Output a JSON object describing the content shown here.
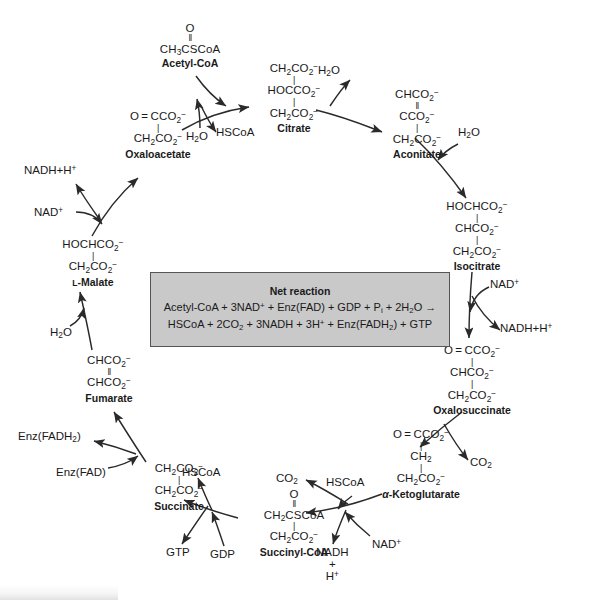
{
  "diagram": {
    "net_box": {
      "heading": "Net reaction",
      "line1_html": "Acetyl-CoA + 3NAD<sup>+</sup> + Enz(FAD) + GDP + P<sub>i</sub> + 2H<sub>2</sub>O →",
      "line2_html": "HSCoA + 2CO<sub>2</sub> + 3NADH + 3H<sup>+</sup> + Enz(FADH<sub>2</sub>) + GTP"
    },
    "metabolites": [
      {
        "id": "acetyl-coa",
        "name": "Acetyl-CoA",
        "structure_html": "<span class='ln'>O</span><span class='bondv'>‖</span><span class='ln'>CH<sub>3</sub>CSCoA</span>"
      },
      {
        "id": "citrate",
        "name": "Citrate",
        "structure_html": "<span class='ln'>CH<sub>2</sub>CO<sub>2</sub><sup>−</sup></span><span class='bondv'>|</span><span class='ln'>HOCCO<sub>2</sub><sup>−</sup></span><span class='bondv'>|</span><span class='ln'>CH<sub>2</sub>CO<sub>2</sub><sup>−</sup></span>"
      },
      {
        "id": "aconitate",
        "name": "Aconitate",
        "structure_html": "<span class='ln'>CHCO<sub>2</sub><sup>−</sup></span><span class='bondv'>‖</span><span class='ln'>CCO<sub>2</sub><sup>−</sup></span><span class='bondv'>|</span><span class='ln'>CH<sub>2</sub>CO<sub>2</sub><sup>−</sup></span>"
      },
      {
        "id": "isocitrate",
        "name": "Isocitrate",
        "structure_html": "<span class='ln'>HOCHCO<sub>2</sub><sup>−</sup></span><span class='bondv'>|</span><span class='ln'>CHCO<sub>2</sub><sup>−</sup></span><span class='bondv'>|</span><span class='ln'>CH<sub>2</sub>CO<sub>2</sub><sup>−</sup></span>"
      },
      {
        "id": "oxalosuccinate",
        "name": "Oxalosuccinate",
        "structure_html": "<span class='ln'>O = CCO<sub>2</sub><sup>−</sup></span><span class='bondv'>|</span><span class='ln'>CHCO<sub>2</sub><sup>−</sup></span><span class='bondv'>|</span><span class='ln'>CH<sub>2</sub>CO<sub>2</sub><sup>−</sup></span>"
      },
      {
        "id": "alpha-ketoglutarate",
        "name_html": "<span class='ital'>α</span>-Ketoglutarate",
        "name": "α-Ketoglutarate",
        "structure_html": "<span class='ln'>O = CCO<sub>2</sub><sup>−</sup></span><span class='bondv'>|</span><span class='ln'>CH<sub>2</sub></span><span class='bondv'>|</span><span class='ln'>CH<sub>2</sub>CO<sub>2</sub><sup>−</sup></span>"
      },
      {
        "id": "succinyl-coa",
        "name": "Succinyl-CoA",
        "structure_html": "<span class='ln'>O</span><span class='bondv'>‖</span><span class='ln'>CH<sub>2</sub>CSCoA</span><span class='bondv'>|</span><span class='ln'>CH<sub>2</sub>CO<sub>2</sub><sup>−</sup></span>"
      },
      {
        "id": "succinate",
        "name": "Succinate",
        "structure_html": "<span class='ln'>CH<sub>2</sub>CO<sub>2</sub><sup>−</sup></span><span class='bondv'>|</span><span class='ln'>CH<sub>2</sub>CO<sub>2</sub><sup>−</sup></span>"
      },
      {
        "id": "fumarate",
        "name": "Fumarate",
        "structure_html": "<span class='ln'>CHCO<sub>2</sub><sup>−</sup></span><span class='bondv'>‖</span><span class='ln'>CHCO<sub>2</sub><sup>−</sup></span>"
      },
      {
        "id": "l-malate",
        "name_html": "<span class='sc'>L</span>-Malate",
        "name": "L-Malate",
        "structure_html": "<span class='ln'>HOCHCO<sub>2</sub><sup>−</sup></span><span class='bondv'>|</span><span class='ln'>CH<sub>2</sub>CO<sub>2</sub><sup>−</sup></span>"
      },
      {
        "id": "oxaloacetate",
        "name": "Oxaloacetate",
        "structure_html": "<span class='ln'>O = CCO<sub>2</sub><sup>−</sup></span><span class='bondv'>|</span><span class='ln'>CH<sub>2</sub>CO<sub>2</sub><sup>−</sup></span>"
      }
    ],
    "cofactors": [
      {
        "id": "h2o-citrate",
        "label_html": "H<sub>2</sub>O"
      },
      {
        "id": "hscoa-citrate",
        "label_html": "HSCoA"
      },
      {
        "id": "h2o-aconitate",
        "label_html": "H<sub>2</sub>O"
      },
      {
        "id": "h2o-isocitrate",
        "label_html": "H<sub>2</sub>O"
      },
      {
        "id": "nad-isocitrate",
        "label_html": "NAD<sup>+</sup>"
      },
      {
        "id": "nadh-isocitrate",
        "label_html": "NADH+H<sup>+</sup>"
      },
      {
        "id": "co2-oxalosuccinate",
        "label_html": "CO<sub>2</sub>"
      },
      {
        "id": "hscoa-akg",
        "label_html": "HSCoA"
      },
      {
        "id": "nad-akg",
        "label_html": "NAD<sup>+</sup>"
      },
      {
        "id": "co2-akg",
        "label_html": "CO<sub>2</sub>"
      },
      {
        "id": "nadh-akg",
        "label_html": "NADH<br>+<br>H<sup>+</sup>"
      },
      {
        "id": "hscoa-succinate",
        "label_html": "HSCoA"
      },
      {
        "id": "gdp",
        "label_html": "GDP"
      },
      {
        "id": "gtp",
        "label_html": "GTP"
      },
      {
        "id": "enz-fad",
        "label_html": "Enz(FAD)"
      },
      {
        "id": "enz-fadh2",
        "label_html": "Enz(FADH<sub>2</sub>)"
      },
      {
        "id": "h2o-fumarate",
        "label_html": "H<sub>2</sub>O"
      },
      {
        "id": "nad-malate",
        "label_html": "NAD<sup>+</sup>"
      },
      {
        "id": "nadh-malate",
        "label_html": "NADH+H<sup>+</sup>"
      }
    ]
  },
  "colors": {
    "ink": "#1a1a1a",
    "box_fill": "#c9c9c9",
    "box_border": "#555555",
    "page": "#ffffff"
  }
}
